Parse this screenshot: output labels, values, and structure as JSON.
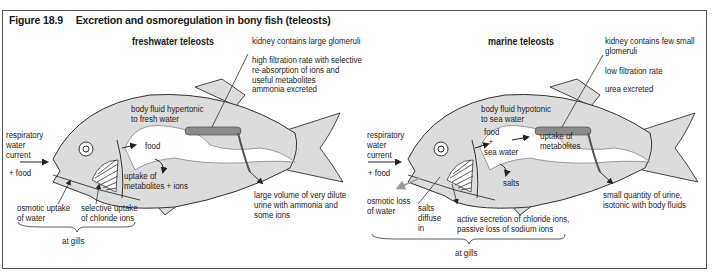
{
  "figure": {
    "number": "Figure 18.9",
    "title": "Excretion and osmoregulation in bony fish (teleosts)"
  },
  "colors": {
    "fish_body": "#dcdcdc",
    "kidney": "#8a8a8a",
    "outline": "#333333",
    "gut": "#ffffff",
    "osmotic_loss_arrow": "#999999"
  },
  "freshwater": {
    "heading": "freshwater teleosts",
    "labels": {
      "kidney": "kidney contains large glomeruli",
      "filtration": "high filtration rate with selective\nre-absorption of ions and\nuseful metabolites",
      "excretion": "ammonia excreted",
      "body_fluid": "body fluid hypertonic\nto fresh water",
      "respiratory": "respiratory\nwater\ncurrent",
      "plus_food": "+ food",
      "food": "food",
      "uptake": "uptake of\nmetabolites + ions",
      "osmotic": "osmotic uptake\nof water",
      "selective": "selective uptake\nof chloride ions",
      "at_gills": "at gills",
      "urine": "large volume of very dilute\nurine with ammonia and\nsome ions"
    }
  },
  "marine": {
    "heading": "marine teleosts",
    "labels": {
      "kidney": "kidney contains few small\nglomeruli",
      "filtration": "low filtration rate",
      "excretion": "urea excreted",
      "body_fluid": "body fluid hypotonic\nto sea water",
      "respiratory": "respiratory\nwater\ncurrent",
      "plus_food": "+ food",
      "food_sea": "food\n  +\nsea water",
      "uptake": "uptake of\nmetabolites",
      "salts": "salts",
      "osmotic": "osmotic loss\nof water",
      "salts_diffuse": "salts\ndiffuse\nin",
      "active": "active secretion of chloride ions,\npassive loss of sodium ions",
      "at_gills": "at gills",
      "urine": "small quantity of urine,\nisotonic with body fluids"
    }
  }
}
